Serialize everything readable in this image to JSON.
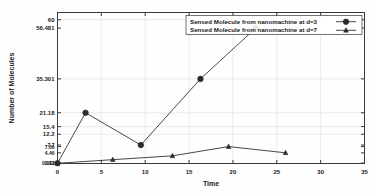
{
  "chart_data": {
    "type": "line",
    "title": "",
    "xlabel": "Time",
    "ylabel": "Number of Molecules",
    "xlim": [
      0,
      35
    ],
    "ylim": [
      0,
      63
    ],
    "grid": true,
    "legend_position": "top-right",
    "xticks": [
      "0",
      "5",
      "10",
      "15",
      "20",
      "25",
      "30",
      "35"
    ],
    "xtick_values": [
      0,
      5,
      10,
      15,
      20,
      25,
      30,
      35
    ],
    "yticks": [
      "60",
      "56.481",
      "35.301",
      "21.18",
      "15.4",
      "12.2",
      "7.7",
      "7.06",
      "4.46",
      "0.13",
      "0.082"
    ],
    "ytick_values": [
      60,
      56.481,
      35.301,
      21.18,
      15.4,
      12.2,
      7.7,
      7.06,
      4.46,
      0.13,
      0.082
    ],
    "series": [
      {
        "name": "Sensed Molecule from nanomachine at d=3",
        "marker": "filled-circle",
        "color": "#2b2b2b",
        "x": [
          0,
          3.2,
          9.5,
          16.3,
          22.6
        ],
        "values": [
          0.13,
          21.18,
          7.7,
          35.301,
          56.481
        ]
      },
      {
        "name": "Sensed Molecule from nanomachine at d=7",
        "marker": "filled-triangle",
        "color": "#2b2b2b",
        "x": [
          0,
          6.3,
          13.1,
          19.5,
          26.0
        ],
        "values": [
          0.082,
          1.6,
          3.2,
          7.06,
          4.46
        ]
      }
    ]
  },
  "legend": {
    "entries": [
      {
        "label": "Sensed Molecule from nanomachine at d=3",
        "marker": "filled-circle"
      },
      {
        "label": "Sensed Molecule from nanomachine at d=7",
        "marker": "filled-triangle"
      }
    ]
  }
}
